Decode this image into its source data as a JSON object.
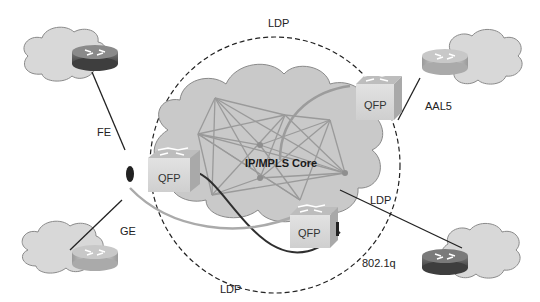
{
  "diagram": {
    "core": {
      "label": "IP/MPLS Core"
    },
    "ldp_labels": {
      "top": "LDP",
      "right": "LDP",
      "bottom": "LDP"
    },
    "qfp_nodes": [
      {
        "id": "qfp-left",
        "label": "QFP"
      },
      {
        "id": "qfp-top-right",
        "label": "QFP"
      },
      {
        "id": "qfp-bottom",
        "label": "QFP"
      }
    ],
    "links": {
      "fe": "FE",
      "ge": "GE",
      "aal5": "AAL5",
      "dot1q": "802.1q"
    },
    "colors": {
      "cloud_fill": "#d4d4d4",
      "cloud_stroke": "#8a8a8a",
      "core_fill": "#c8c8c8",
      "mesh_line": "#9a9a9a",
      "qfp_fill": "#d9d9d9",
      "router_dark": "#5a5a5a",
      "router_light": "#c9c9c9"
    }
  }
}
